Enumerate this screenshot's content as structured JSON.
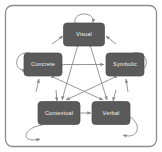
{
  "figure": {
    "type": "diagram",
    "kind": "network-graph",
    "title": "",
    "border": {
      "shape": "rounded-rectangle",
      "color": "#8c8c8c",
      "fill": "#ffffff"
    },
    "style": {
      "node_fill": "#5a5a5a",
      "node_stroke": "#4a4a4a",
      "node_text_color": "#f2f2f2",
      "edge_color": "#8a8a8a",
      "background": "#ffffff"
    },
    "nodes": [
      {
        "id": "visual",
        "label": "Visual",
        "x": 84,
        "y": 34.5,
        "w": 41,
        "h": 23
      },
      {
        "id": "concrete",
        "label": "Concrete",
        "x": 43,
        "y": 64.5,
        "w": 38,
        "h": 23
      },
      {
        "id": "symbolic",
        "label": "Symbolic",
        "x": 125,
        "y": 64.5,
        "w": 38,
        "h": 23
      },
      {
        "id": "contextual",
        "label": "Contextual",
        "x": 59,
        "y": 113,
        "w": 42,
        "h": 23
      },
      {
        "id": "verbal",
        "label": "Verbal",
        "x": 111,
        "y": 113,
        "w": 38,
        "h": 23
      }
    ],
    "edges": [
      {
        "from": "concrete",
        "to": "symbolic",
        "arrow": "double",
        "shape": "straight"
      },
      {
        "from": "visual",
        "to": "contextual",
        "arrow": "double",
        "shape": "straight"
      },
      {
        "from": "visual",
        "to": "verbal",
        "arrow": "double",
        "shape": "straight"
      },
      {
        "from": "concrete",
        "to": "verbal",
        "arrow": "double",
        "shape": "straight"
      },
      {
        "from": "symbolic",
        "to": "contextual",
        "arrow": "double",
        "shape": "straight"
      },
      {
        "from": "contextual",
        "to": "verbal",
        "arrow": "double",
        "shape": "straight"
      }
    ],
    "self_loops": [
      {
        "node": "visual",
        "position": "top"
      },
      {
        "node": "concrete",
        "position": "left"
      },
      {
        "node": "symbolic",
        "position": "right"
      },
      {
        "node": "contextual",
        "position": "bottom-left"
      },
      {
        "node": "verbal",
        "position": "bottom-right"
      }
    ],
    "incoming_arrows": [
      {
        "node": "visual",
        "position": "upper-left"
      },
      {
        "node": "visual",
        "position": "upper-right"
      },
      {
        "node": "concrete",
        "position": "lower"
      },
      {
        "node": "symbolic",
        "position": "lower"
      },
      {
        "node": "contextual",
        "position": "upper"
      },
      {
        "node": "verbal",
        "position": "upper"
      }
    ]
  }
}
